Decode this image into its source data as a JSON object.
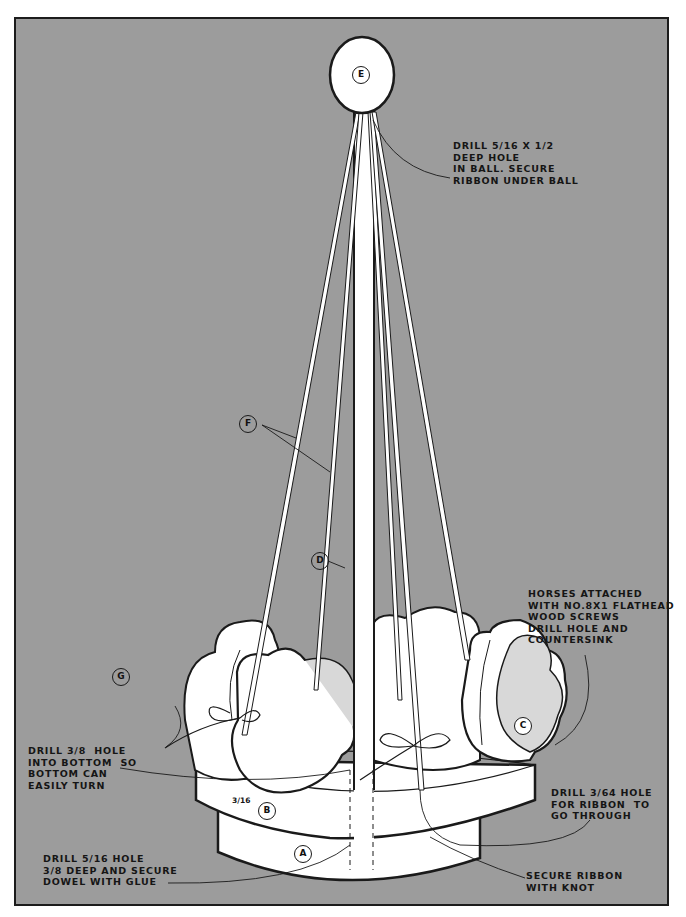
{
  "diagram": {
    "colors": {
      "background": "#9c9c9c",
      "page": "#ffffff",
      "part_fill": "#ffffff",
      "part_shade": "#d8d8d8",
      "outline": "#1a1a1a"
    },
    "part_labels": {
      "A": "A",
      "B": "B",
      "C": "C",
      "D": "D",
      "E": "E",
      "F": "F",
      "G": "G"
    },
    "dimension": "3/16",
    "notes": {
      "ball_hole": "DRILL 5/16 X 1/2\nDEEP HOLE\nIN BALL. SECURE\nRIBBON UNDER BALL",
      "horses": "HORSES ATTACHED\nWITH NO.8X1 FLATHEAD\nWOOD SCREWS\nDRILL HOLE AND\nCOUNTERSINK",
      "bottom_hole": "DRILL 3/8  HOLE\nINTO BOTTOM  SO\nBOTTOM CAN\nEASILY TURN",
      "ribbon_hole": "DRILL 3/64 HOLE\nFOR RIBBON  TO\nGO THROUGH",
      "dowel_hole": "DRILL 5/16 HOLE\n3/8 DEEP AND SECURE\nDOWEL WITH GLUE",
      "knot": "SECURE RIBBON\nWITH KNOT"
    }
  }
}
